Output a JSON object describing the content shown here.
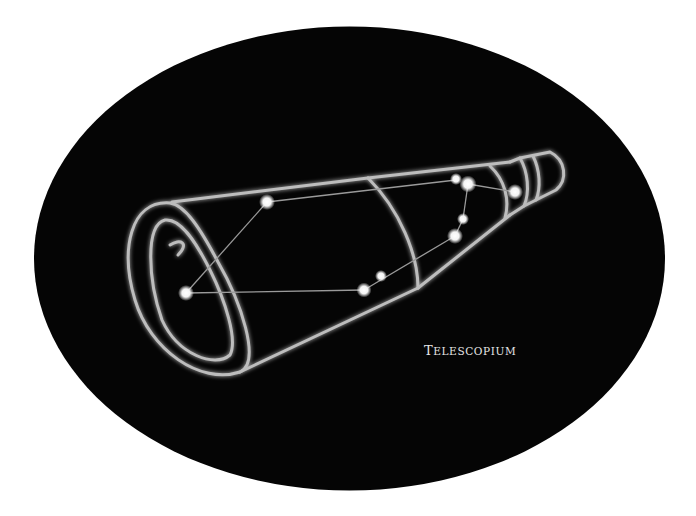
{
  "constellation": {
    "name": "Telescopium",
    "label_first": "T",
    "label_rest": "ELESCOPIUM"
  },
  "colors": {
    "background": "#ffffff",
    "sky": "#050505",
    "outline": "#bdbdbd",
    "star": "#ffffff",
    "line": "#9a9a9a"
  },
  "stars": [
    {
      "x": 267,
      "y": 202,
      "r": 4.5
    },
    {
      "x": 186,
      "y": 293,
      "r": 4.5
    },
    {
      "x": 364,
      "y": 290,
      "r": 4.5
    },
    {
      "x": 381,
      "y": 276,
      "r": 3.5
    },
    {
      "x": 456,
      "y": 179,
      "r": 3.5
    },
    {
      "x": 468,
      "y": 184,
      "r": 5.5
    },
    {
      "x": 515,
      "y": 192,
      "r": 5
    },
    {
      "x": 463,
      "y": 219,
      "r": 3.5
    },
    {
      "x": 455,
      "y": 236,
      "r": 5
    }
  ]
}
